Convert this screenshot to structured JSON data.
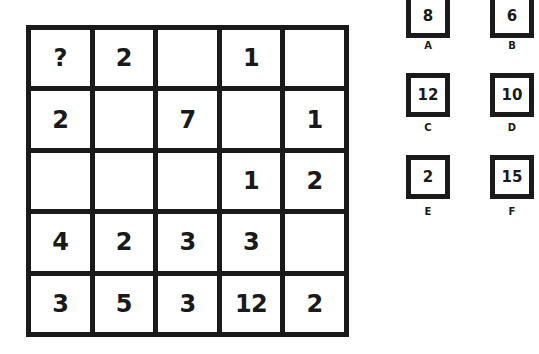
{
  "puzzle": {
    "grid": [
      [
        "?",
        "2",
        "",
        "1",
        ""
      ],
      [
        "2",
        "",
        "7",
        "",
        "1"
      ],
      [
        "",
        "",
        "",
        "1",
        "2"
      ],
      [
        "4",
        "2",
        "3",
        "3",
        ""
      ],
      [
        "3",
        "5",
        "3",
        "12",
        "2"
      ]
    ]
  },
  "options": [
    {
      "letter": "A",
      "value": "8"
    },
    {
      "letter": "B",
      "value": "6"
    },
    {
      "letter": "C",
      "value": "12"
    },
    {
      "letter": "D",
      "value": "10"
    },
    {
      "letter": "E",
      "value": "2"
    },
    {
      "letter": "F",
      "value": "15"
    }
  ]
}
